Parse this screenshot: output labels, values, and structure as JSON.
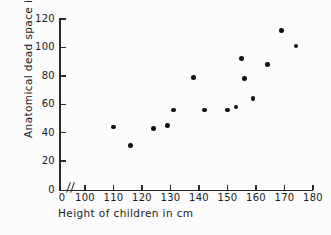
{
  "chart_data": {
    "type": "scatter",
    "title": "",
    "xlabel": "Height of children in cm",
    "ylabel": "Anatomical dead space in ml",
    "xlim": [
      100,
      180
    ],
    "ylim": [
      0,
      120
    ],
    "x_ticks": [
      0,
      100,
      110,
      120,
      130,
      140,
      150,
      160,
      170,
      180
    ],
    "y_ticks": [
      0,
      20,
      40,
      60,
      80,
      100,
      120
    ],
    "x_tick_labels": [
      "0",
      "100",
      "110",
      "120",
      "130",
      "140",
      "150",
      "160",
      "170",
      "180"
    ],
    "y_tick_labels": [
      "0",
      "20",
      "40",
      "60",
      "80",
      "100",
      "120"
    ],
    "axis_break": true,
    "grid": false,
    "legend": "none",
    "marker_color": "#111111",
    "axis_color": "#2a2a2a",
    "points": [
      {
        "x": 110,
        "y": 44
      },
      {
        "x": 116,
        "y": 31
      },
      {
        "x": 124,
        "y": 43
      },
      {
        "x": 129,
        "y": 45
      },
      {
        "x": 131,
        "y": 56
      },
      {
        "x": 138,
        "y": 79
      },
      {
        "x": 142,
        "y": 56
      },
      {
        "x": 150,
        "y": 56
      },
      {
        "x": 153,
        "y": 58
      },
      {
        "x": 155,
        "y": 92
      },
      {
        "x": 156,
        "y": 78
      },
      {
        "x": 159,
        "y": 64
      },
      {
        "x": 164,
        "y": 88
      },
      {
        "x": 169,
        "y": 112
      },
      {
        "x": 174,
        "y": 101
      }
    ]
  }
}
